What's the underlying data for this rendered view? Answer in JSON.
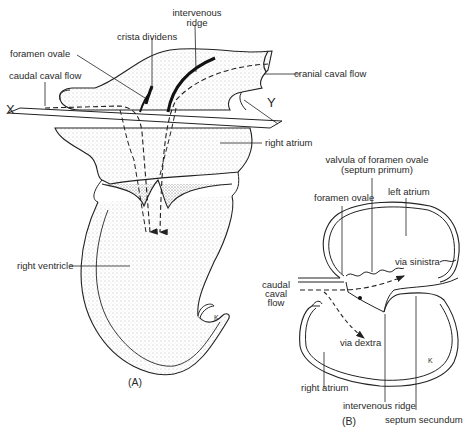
{
  "figure": {
    "panel_a": {
      "label": "(A)",
      "axis_markers": {
        "left": "X",
        "right": "Y"
      },
      "labels": {
        "intervenous_ridge_line1": "intervenous",
        "intervenous_ridge_line2": "ridge",
        "crista_dividens": "crista dividens",
        "foramen_ovale": "foramen ovale",
        "caudal_caval_flow": "caudal caval flow",
        "cranial_caval_flow": "cranial caval flow",
        "right_atrium": "right atrium",
        "right_ventricle": "right ventricle",
        "k_marker": "K"
      }
    },
    "panel_b": {
      "label": "(B)",
      "labels": {
        "valvula_line1": "valvula of foramen ovale",
        "valvula_line2": "(septum primum)",
        "foramen_ovale": "foramen ovale",
        "left_atrium": "left atrium",
        "via_sinistra": "via sinistra",
        "caudal_line1": "caudal",
        "caudal_line2": "caval",
        "caudal_line3": "flow",
        "via_dextra": "via dextra",
        "right_atrium": "right atrium",
        "intervenous_ridge": "intervenous ridge",
        "septum_secundum": "septum secundum",
        "k_marker": "K"
      }
    }
  }
}
